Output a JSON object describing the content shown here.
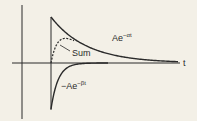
{
  "diagram": {
    "labels": {
      "t_axis": "t",
      "positive_curve": "Ae",
      "positive_exp": "−αt",
      "sum": "Sum",
      "negative_curve": "−Ae",
      "negative_exp": "−βt"
    },
    "curves": [
      {
        "name": "Ae^(-alpha t)",
        "style": "solid",
        "sign": "positive",
        "decay": "slow"
      },
      {
        "name": "-Ae^(-beta t)",
        "style": "solid",
        "sign": "negative",
        "decay": "fast"
      },
      {
        "name": "Sum",
        "style": "dashed"
      }
    ],
    "colors": {
      "ink": "#2a2a2a",
      "paper": "#f3f0e7"
    }
  }
}
